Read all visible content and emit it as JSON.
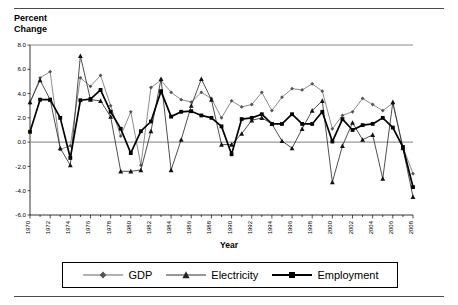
{
  "axis_title": {
    "y": "Percent\nChange",
    "x": "Year"
  },
  "legend": {
    "items": [
      {
        "label": "GDP",
        "marker": "diamond-marker",
        "color": "#555555"
      },
      {
        "label": "Electricity",
        "marker": "triangle-marker",
        "color": "#333333"
      },
      {
        "label": "Employment",
        "marker": "square-marker",
        "color": "#000000"
      }
    ]
  },
  "chart_data": {
    "type": "line",
    "title": "",
    "xlabel": "Year",
    "ylabel": "Percent Change",
    "ylim": [
      -6.0,
      8.0
    ],
    "ytick_labels": [
      "8.0",
      "6.0",
      "4.0",
      "2.0",
      "0.0",
      "-2.0",
      "-4.0",
      "-6.0"
    ],
    "ytick_values": [
      8.0,
      6.0,
      4.0,
      2.0,
      0.0,
      -2.0,
      -4.0,
      -6.0
    ],
    "grid": false,
    "legend_position": "bottom",
    "x": [
      1970,
      1971,
      1972,
      1973,
      1974,
      1975,
      1976,
      1977,
      1978,
      1979,
      1980,
      1981,
      1982,
      1983,
      1984,
      1985,
      1986,
      1987,
      1988,
      1989,
      1990,
      1991,
      1992,
      1993,
      1994,
      1995,
      1996,
      1997,
      1998,
      1999,
      2000,
      2001,
      2002,
      2003,
      2004,
      2005,
      2006,
      2007,
      2008
    ],
    "xtick_labels": [
      "1970",
      "1972",
      "1974",
      "1976",
      "1978",
      "1980",
      "1982",
      "1984",
      "1986",
      "1988",
      "1990",
      "1992",
      "1994",
      "1996",
      "1998",
      "2000",
      "2002",
      "2004",
      "2006",
      "2008"
    ],
    "xtick_values": [
      1970,
      1972,
      1974,
      1976,
      1978,
      1980,
      1982,
      1984,
      1986,
      1988,
      1990,
      1992,
      1994,
      1996,
      1998,
      2000,
      2002,
      2004,
      2006,
      2008
    ],
    "series": [
      {
        "name": "GDP",
        "marker": "diamond",
        "values": [
          3.2,
          5.3,
          5.8,
          -0.6,
          -0.3,
          5.3,
          4.6,
          5.5,
          3.0,
          0.5,
          2.5,
          -1.9,
          4.5,
          5.1,
          4.1,
          3.5,
          3.3,
          4.1,
          3.6,
          2.0,
          3.4,
          2.9,
          3.1,
          4.1,
          2.6,
          3.7,
          4.4,
          4.3,
          4.8,
          4.2,
          1.1,
          2.2,
          2.5,
          3.6,
          3.1,
          2.6,
          3.2,
          -0.4,
          -2.6
        ]
      },
      {
        "name": "Electricity",
        "marker": "triangle",
        "values": [
          3.3,
          5.1,
          3.5,
          -0.5,
          -1.9,
          7.1,
          3.5,
          3.4,
          2.1,
          -2.4,
          -2.4,
          -2.3,
          0.9,
          5.2,
          -2.3,
          0.2,
          3.0,
          5.2,
          3.5,
          -0.2,
          -0.2,
          0.7,
          1.8,
          2.0,
          1.5,
          0.1,
          -0.5,
          1.1,
          2.6,
          3.4,
          -3.3,
          -0.3,
          1.6,
          0.2,
          0.6,
          -3.0,
          3.3,
          -0.5,
          -4.5
        ]
      },
      {
        "name": "Employment",
        "marker": "square",
        "values": [
          0.85,
          3.5,
          3.5,
          2.0,
          -1.3,
          3.45,
          3.55,
          4.3,
          2.5,
          1.1,
          -0.9,
          0.9,
          1.7,
          4.2,
          2.1,
          2.5,
          2.55,
          2.2,
          2.0,
          1.3,
          -1.0,
          1.9,
          2.0,
          2.3,
          1.5,
          1.5,
          2.3,
          1.5,
          1.5,
          2.5,
          0.05,
          1.9,
          1.0,
          1.4,
          1.5,
          2.0,
          1.2,
          -0.4,
          -3.7
        ]
      }
    ]
  }
}
